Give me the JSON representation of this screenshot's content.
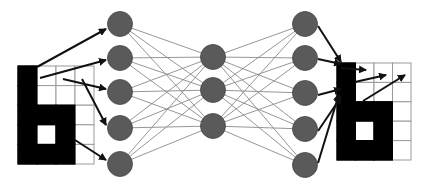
{
  "diagram": {
    "type": "autoencoder-neural-network",
    "colors": {
      "node_fill": "#5a5a5a",
      "node_stroke": "#444444",
      "edge": "#8a8a8a",
      "arrow": "#111111",
      "pixel_on": "#000000",
      "pixel_off": "#ffffff",
      "grid_line": "#9a9a9a"
    },
    "node_radius": 12.5,
    "layers": [
      {
        "name": "input",
        "x": 120,
        "ys": [
          24,
          58,
          92,
          128,
          164
        ]
      },
      {
        "name": "hidden",
        "x": 213,
        "ys": [
          57,
          90,
          126
        ]
      },
      {
        "name": "output",
        "x": 305,
        "ys": [
          24,
          58,
          93,
          129,
          165
        ]
      }
    ],
    "input_image": {
      "x": 18,
      "y": 66,
      "cell_w": 19,
      "cell_h": 19.6,
      "cols": 4,
      "rows": 5,
      "pixels": [
        [
          1,
          0,
          0,
          0
        ],
        [
          1,
          0,
          0,
          0
        ],
        [
          1,
          1,
          1,
          0
        ],
        [
          1,
          0,
          1,
          0
        ],
        [
          1,
          1,
          1,
          0
        ]
      ]
    },
    "output_image": {
      "x": 337,
      "y": 63,
      "cell_w": 18.5,
      "cell_h": 19.4,
      "cols": 4,
      "rows": 5,
      "pixels": [
        [
          1,
          0,
          0,
          0
        ],
        [
          1,
          0,
          0,
          0
        ],
        [
          1,
          1,
          1,
          0
        ],
        [
          1,
          0,
          1,
          0
        ],
        [
          1,
          1,
          1,
          0
        ]
      ]
    },
    "input_arrows": [
      {
        "x1": 37,
        "y1": 67,
        "x2": 106,
        "y2": 29
      },
      {
        "x1": 40,
        "y1": 78,
        "x2": 106,
        "y2": 60
      },
      {
        "x1": 63,
        "y1": 79,
        "x2": 106,
        "y2": 89
      },
      {
        "x1": 82,
        "y1": 79,
        "x2": 106,
        "y2": 125
      },
      {
        "x1": 75,
        "y1": 140,
        "x2": 106,
        "y2": 160
      }
    ],
    "output_arrows": [
      {
        "x1": 318,
        "y1": 26,
        "x2": 341,
        "y2": 62
      },
      {
        "x1": 318,
        "y1": 59,
        "x2": 341,
        "y2": 64
      },
      {
        "x1": 318,
        "y1": 95,
        "x2": 341,
        "y2": 89
      },
      {
        "x1": 318,
        "y1": 131,
        "x2": 341,
        "y2": 97
      },
      {
        "x1": 318,
        "y1": 163,
        "x2": 339,
        "y2": 94
      },
      {
        "x1": 341,
        "y1": 68,
        "x2": 366,
        "y2": 70
      },
      {
        "x1": 355,
        "y1": 82,
        "x2": 386,
        "y2": 75
      },
      {
        "x1": 363,
        "y1": 101,
        "x2": 405,
        "y2": 75
      }
    ]
  }
}
